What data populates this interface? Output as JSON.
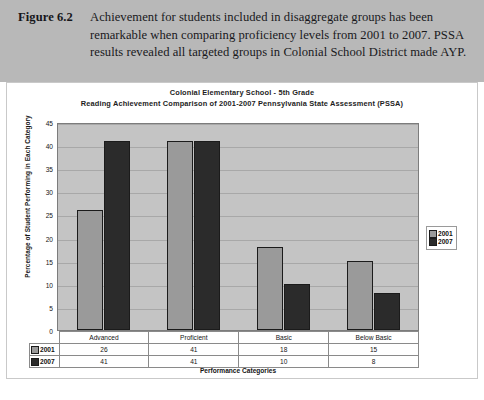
{
  "caption": {
    "label": "Figure 6.2",
    "text": "Achievement for students included in disaggregate groups has been remarkable when comparing proficiency levels from 2001 to 2007. PSSA results revealed all targeted groups in Colonial School District made AYP."
  },
  "chart_data": {
    "type": "bar",
    "title": "Colonial Elementary School - 5th Grade",
    "subtitle": "Reading Achievement Comparison of 2001-2007 Pennsylvania State Assessment (PSSA)",
    "xlabel": "Performance Categories",
    "ylabel": "Percentage of Student Performing in Each Category",
    "categories": [
      "Advanced",
      "Proficient",
      "Basic",
      "Below Basic"
    ],
    "series": [
      {
        "name": "2001",
        "color": "#9a9a9a",
        "values": [
          26,
          41,
          18,
          15
        ]
      },
      {
        "name": "2007",
        "color": "#2b2b2b",
        "values": [
          41,
          41,
          10,
          8
        ]
      }
    ],
    "ylim": [
      0,
      45
    ],
    "yticks": [
      0,
      5,
      10,
      15,
      20,
      25,
      30,
      35,
      40,
      45
    ],
    "grid": true,
    "legend_position": "right",
    "legend_entries": [
      "2001",
      "2007"
    ],
    "data_table": {
      "columns": [
        "Advanced",
        "Proficient",
        "Basic",
        "Below Basic"
      ],
      "rows": [
        {
          "label": "2001",
          "values": [
            "26",
            "41",
            "18",
            "15"
          ]
        },
        {
          "label": "2007",
          "values": [
            "41",
            "41",
            "10",
            "8"
          ]
        }
      ]
    }
  },
  "colors": {
    "caption_band": "#b8b8b8",
    "plot_background": "#c4c4c4",
    "series_2001": "#9a9a9a",
    "series_2007": "#2b2b2b"
  }
}
